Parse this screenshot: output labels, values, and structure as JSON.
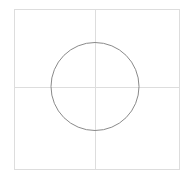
{
  "diagram": {
    "frame": {
      "x": 14,
      "y": 9,
      "width": 165,
      "height": 160,
      "stroke": "#dddddd"
    },
    "crosshair": {
      "cx": 95,
      "cy": 87,
      "stroke": "#dddddd"
    },
    "circle": {
      "cx": 95,
      "cy": 86.5,
      "r": 44,
      "stroke": "#8a8a8a"
    }
  }
}
